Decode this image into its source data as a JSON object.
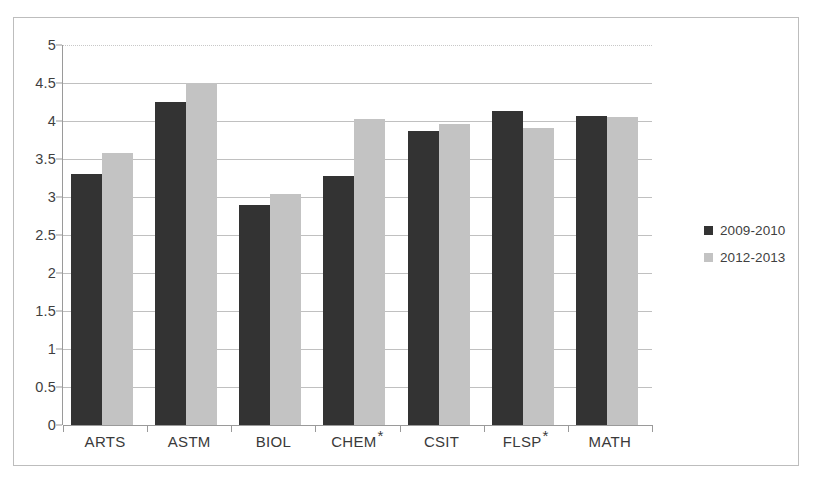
{
  "chart_data": {
    "type": "bar",
    "title": "",
    "subtitle": "",
    "xlabel": "",
    "ylabel": "",
    "ylim": [
      0,
      5
    ],
    "yticks": [
      "0",
      "0.5",
      "1",
      "1.5",
      "2",
      "2.5",
      "3",
      "3.5",
      "4",
      "4.5",
      "5"
    ],
    "ytick_values": [
      0,
      0.5,
      1,
      1.5,
      2,
      2.5,
      3,
      3.5,
      4,
      4.5,
      5
    ],
    "grid": true,
    "legend_position": "right",
    "categories": [
      "ARTS",
      "ASTM",
      "BIOL",
      "CHEM *",
      "CSIT",
      "FLSP *",
      "MATH"
    ],
    "category_labels": [
      {
        "text": "ARTS",
        "star": ""
      },
      {
        "text": "ASTM",
        "star": ""
      },
      {
        "text": "BIOL",
        "star": ""
      },
      {
        "text": "CHEM",
        "star": "*"
      },
      {
        "text": "CSIT",
        "star": ""
      },
      {
        "text": "FLSP",
        "star": "*"
      },
      {
        "text": "MATH",
        "star": ""
      }
    ],
    "series": [
      {
        "name": "2009-2010",
        "color": "#333333",
        "values": [
          3.3,
          4.25,
          2.89,
          3.28,
          3.87,
          4.13,
          4.06
        ]
      },
      {
        "name": "2012-2013",
        "color": "#c3c3c3",
        "values": [
          3.58,
          4.5,
          3.04,
          4.02,
          3.96,
          3.91,
          4.05
        ]
      }
    ]
  },
  "legend": {
    "items": [
      {
        "label": "2009-2010",
        "color": "#333333"
      },
      {
        "label": "2012-2013",
        "color": "#c3c3c3"
      }
    ]
  },
  "colors": {
    "series_2009_2010": "#333333",
    "series_2012_2013": "#c3c3c3",
    "gridline": "#c0c0c0",
    "axis": "#9a9a9a",
    "border": "#bdbdbd",
    "text": "#3f3f3f",
    "background": "#ffffff"
  }
}
